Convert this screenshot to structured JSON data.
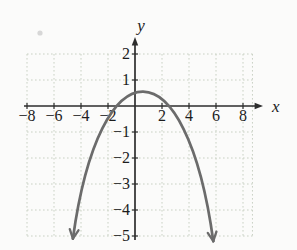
{
  "figure": {
    "background": "#fbfbfa",
    "has_scan_artifact_dot": true
  },
  "chart_data": {
    "type": "line",
    "title": "",
    "xlabel": "x",
    "ylabel": "y",
    "x_ticks": [
      -8,
      -6,
      -4,
      -2,
      2,
      4,
      6,
      8
    ],
    "x_tick_labels": [
      "−8",
      "−6",
      "−4",
      "−2",
      "2",
      "4",
      "6",
      "8"
    ],
    "y_ticks": [
      2,
      1,
      -1,
      -2,
      -3,
      -4,
      -5
    ],
    "y_tick_labels": [
      "2",
      "1",
      "−1",
      "−2",
      "−3",
      "−4",
      "−5"
    ],
    "xlim": [
      -9,
      9.6
    ],
    "ylim": [
      -5.4,
      2.9
    ],
    "grid": "dotted",
    "grid_x_range": [
      -8,
      8.7
    ],
    "grid_y_range": [
      -5,
      2
    ],
    "legend": "none",
    "series": [
      {
        "name": "parabola",
        "description": "downward-opening parabola with arrows on both ends",
        "vertex": [
          0.6,
          0.55
        ],
        "x_intercepts": [
          -1.4,
          2.2
        ],
        "end_points": [
          [
            -4.6,
            -5.1
          ],
          [
            5.8,
            -5.2
          ]
        ],
        "arrows": "both ends",
        "color": "#6b6b6b"
      }
    ],
    "colors": {
      "grid": "#c9d1c4",
      "axis": "#2d2d2d",
      "text": "#1c1c1c",
      "curve": "#6b6b6b",
      "artifact": "#b9b9b9"
    }
  }
}
